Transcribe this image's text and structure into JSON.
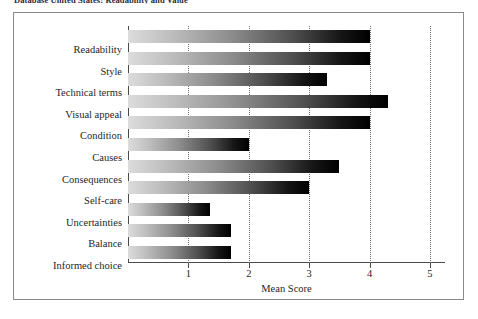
{
  "caption": "Database United States: Readability and Value",
  "chart_data": {
    "type": "bar",
    "orientation": "horizontal",
    "title": "",
    "xlabel": "Mean Score",
    "ylabel": "",
    "xlim": [
      0,
      5.25
    ],
    "xticks": [
      "1",
      "2",
      "3",
      "4",
      "5"
    ],
    "xtick_values": [
      1,
      2,
      3,
      4,
      5
    ],
    "grid": "vertical-dotted",
    "legend": "none",
    "categories": [
      "Readability",
      "Style",
      "Technical terms",
      "Visual appeal",
      "Condition",
      "Causes",
      "Consequences",
      "Self-care",
      "Uncertainties",
      "Balance",
      "Informed choice"
    ],
    "values": [
      4.0,
      4.0,
      3.3,
      4.3,
      4.0,
      2.0,
      3.5,
      3.0,
      1.35,
      1.7,
      1.7
    ],
    "bar_fill": "gradient-light-gray-to-black",
    "bar_color_start": "#dcdcdc",
    "bar_color_end": "#000000"
  }
}
